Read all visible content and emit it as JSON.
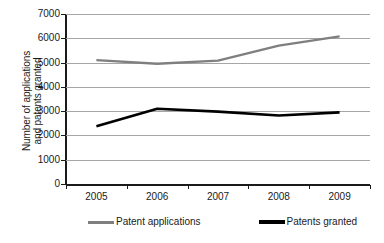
{
  "chart_data": {
    "type": "line",
    "title": "",
    "xlabel": "",
    "ylabel": "Number of applications and patents granted",
    "ylabel_line1": "Number of applications",
    "ylabel_line2": "and patents granted",
    "categories": [
      "2005",
      "2006",
      "2007",
      "2008",
      "2009"
    ],
    "ylim": [
      0,
      7000
    ],
    "ytick_values": [
      "7000",
      "6000",
      "5000",
      "4000",
      "3000",
      "2000",
      "1000",
      "0"
    ],
    "ytick_step": 1000,
    "grid": "horizontal",
    "legend_position": "bottom",
    "series": [
      {
        "name": "Patent applications",
        "color": "#7f7f7f",
        "values": [
          5100,
          4950,
          5080,
          5700,
          6080
        ]
      },
      {
        "name": "Patents granted",
        "color": "#000000",
        "values": [
          2380,
          3100,
          2980,
          2820,
          2950
        ]
      }
    ]
  }
}
